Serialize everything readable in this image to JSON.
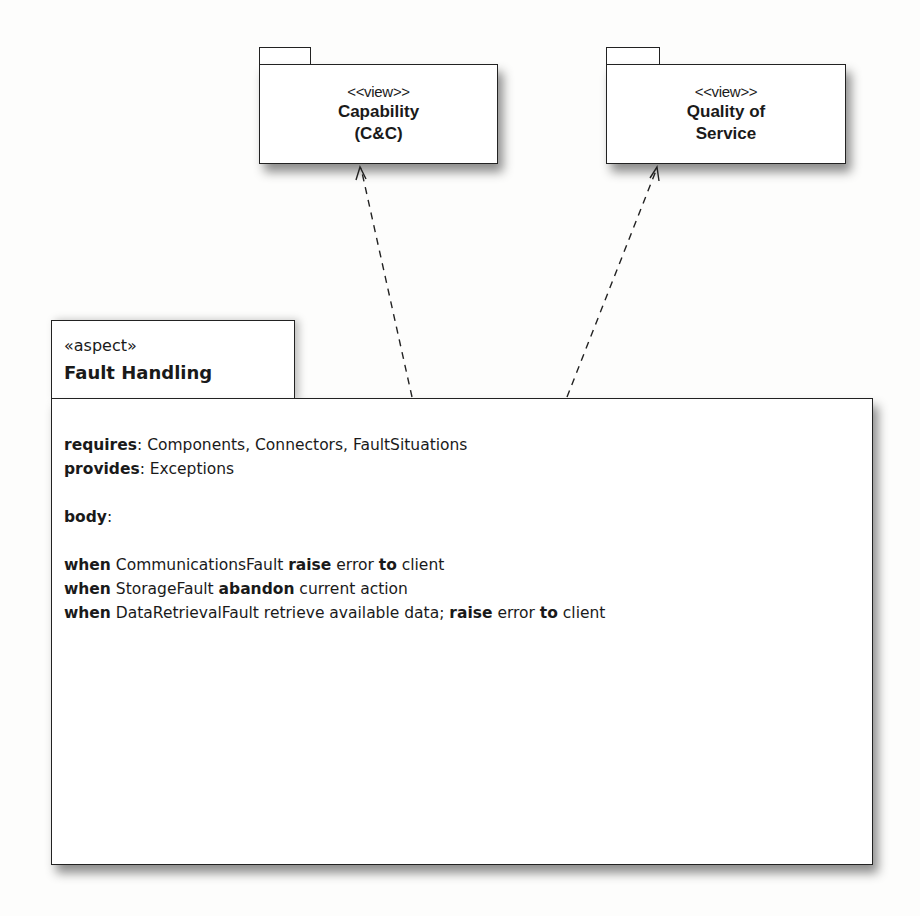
{
  "diagram": {
    "type": "UML package diagram",
    "packages": [
      {
        "id": "capability",
        "stereotype": "<<view>>",
        "name_lines": [
          "Capability",
          "(C&C)"
        ]
      },
      {
        "id": "quality-of-service",
        "stereotype": "<<view>>",
        "name_lines": [
          "Quality of",
          "Service"
        ]
      }
    ],
    "aspect": {
      "stereotype": "«aspect»",
      "name": "Fault Handling",
      "requires_label": "requires",
      "requires_value": ": Components, Connectors, FaultSituations",
      "provides_label": "provides",
      "provides_value": ": Exceptions",
      "body_label": "body",
      "body_colon": ":",
      "rules": [
        [
          {
            "t": "when",
            "b": true
          },
          {
            "t": " CommunicationsFault ",
            "b": false
          },
          {
            "t": "raise",
            "b": true
          },
          {
            "t": " error ",
            "b": false
          },
          {
            "t": "to",
            "b": true
          },
          {
            "t": " client",
            "b": false
          }
        ],
        [
          {
            "t": "when",
            "b": true
          },
          {
            "t": " StorageFault ",
            "b": false
          },
          {
            "t": "abandon",
            "b": true
          },
          {
            "t": " current action",
            "b": false
          }
        ],
        [
          {
            "t": "when",
            "b": true
          },
          {
            "t": " DataRetrievalFault retrieve available data; ",
            "b": false
          },
          {
            "t": "raise",
            "b": true
          },
          {
            "t": " error ",
            "b": false
          },
          {
            "t": "to",
            "b": true
          },
          {
            "t": " client",
            "b": false
          }
        ]
      ]
    },
    "dependencies": [
      {
        "from": "Fault Handling",
        "to": "Capability (C&C)",
        "style": "dashed, open arrowhead"
      },
      {
        "from": "Fault Handling",
        "to": "Quality of Service",
        "style": "dashed, open arrowhead"
      }
    ],
    "colors": {
      "line": "#222222",
      "fill": "#ffffff",
      "background": "#fdfdfc"
    }
  }
}
